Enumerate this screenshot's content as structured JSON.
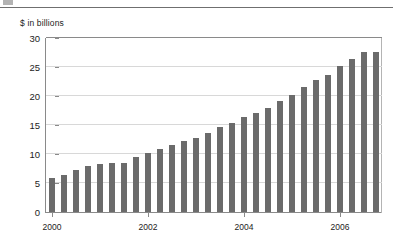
{
  "figure": {
    "top_rule": true,
    "caption_stub": true
  },
  "chart_data": {
    "type": "bar",
    "title": "",
    "subtitle": "",
    "xlabel": "",
    "ylabel": "$ in billions",
    "ylim": [
      0,
      30
    ],
    "yticks": [
      0,
      5,
      10,
      15,
      20,
      25,
      30
    ],
    "ytick_labels": [
      "0",
      "5",
      "10",
      "15",
      "20",
      "25",
      "30"
    ],
    "xtick_labels": [
      "2000",
      "2002",
      "2004",
      "2006"
    ],
    "xtick_positions": [
      0,
      8,
      16,
      24
    ],
    "grid": true,
    "legend": null,
    "bar_color": "#6b6b6b",
    "grid_color": "#d8d8d8",
    "axis_color": "#8a8a8a",
    "categories": [
      "2000 Q1",
      "2000 Q2",
      "2000 Q3",
      "2000 Q4",
      "2001 Q1",
      "2001 Q2",
      "2001 Q3",
      "2001 Q4",
      "2002 Q1",
      "2002 Q2",
      "2002 Q3",
      "2002 Q4",
      "2003 Q1",
      "2003 Q2",
      "2003 Q3",
      "2003 Q4",
      "2004 Q1",
      "2004 Q2",
      "2004 Q3",
      "2004 Q4",
      "2005 Q1",
      "2005 Q2",
      "2005 Q3",
      "2005 Q4",
      "2006 Q1",
      "2006 Q2",
      "2006 Q3",
      "2006 Q4"
    ],
    "values": [
      5.8,
      6.4,
      7.3,
      7.9,
      8.3,
      8.5,
      8.4,
      9.4,
      10.1,
      10.8,
      11.5,
      12.3,
      12.8,
      13.7,
      14.7,
      15.4,
      16.4,
      17.1,
      18.0,
      19.2,
      20.1,
      21.5,
      22.8,
      23.6,
      25.2,
      26.3,
      27.6,
      27.6
    ]
  }
}
